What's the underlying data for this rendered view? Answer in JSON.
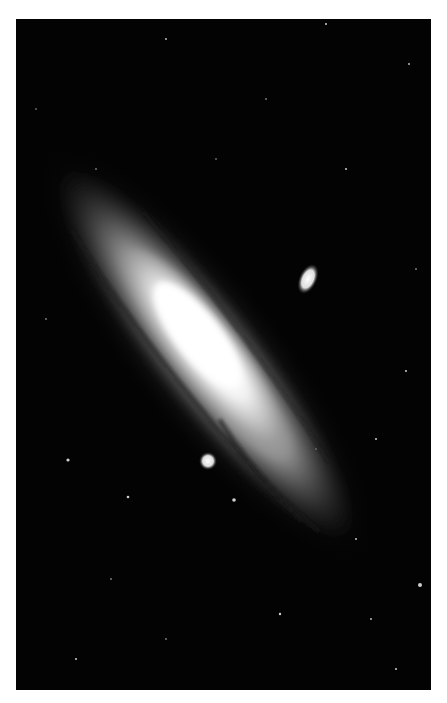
{
  "image": {
    "subject": "spiral galaxy photograph",
    "palette": {
      "sky": "#030303",
      "core": "#ffffff",
      "disk": "#bdbdbd",
      "margin": "#ffffff"
    }
  },
  "galaxy": {
    "cx": 190,
    "cy": 335,
    "angle": 52,
    "rx_outer": 250,
    "ry_outer": 62
  },
  "companions": [
    {
      "name": "elliptical-companion",
      "cx": 292,
      "cy": 260,
      "rx": 10,
      "ry": 16
    },
    {
      "name": "compact-companion",
      "cx": 192,
      "cy": 442,
      "r": 8
    }
  ]
}
